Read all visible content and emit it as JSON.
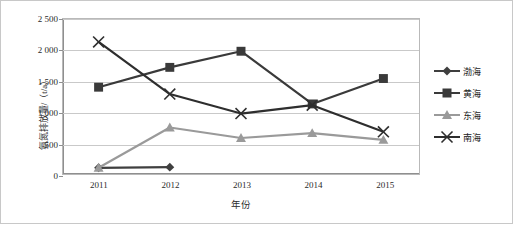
{
  "chart_data": {
    "type": "line",
    "title": "",
    "xlabel": "年份",
    "ylabel": "氨氮排放量/（t/a）",
    "x": [
      "2011",
      "2012",
      "2013",
      "2014",
      "2015"
    ],
    "categories": [
      "2011",
      "2012",
      "2013",
      "2014",
      "2015"
    ],
    "ylim": [
      0,
      2500
    ],
    "yticks": [
      0,
      500,
      1000,
      1500,
      2000,
      2500
    ],
    "ytick_labels": [
      "0",
      "500",
      "1 000",
      "1 500",
      "2 000",
      "2 500"
    ],
    "grid": true,
    "legend_position": "right",
    "series": [
      {
        "name": "渤海",
        "marker": "diamond",
        "color": "#3f3f3f",
        "values": [
          100,
          110,
          null,
          null,
          null
        ]
      },
      {
        "name": "黄海",
        "marker": "square",
        "color": "#3a3a3a",
        "values": [
          1400,
          1720,
          1980,
          1130,
          1540
        ]
      },
      {
        "name": "东海",
        "marker": "triangle",
        "color": "#9a9a9a",
        "values": [
          100,
          750,
          580,
          660,
          550
        ]
      },
      {
        "name": "南海",
        "marker": "x",
        "color": "#2e2e2e",
        "values": [
          2130,
          1290,
          975,
          1110,
          680
        ]
      }
    ]
  },
  "axis": {
    "y_label": "氨氮排放量/（t/a）",
    "x_label": "年份",
    "y_tick_0": "0",
    "y_tick_1": "500",
    "y_tick_2": "1 000",
    "y_tick_3": "1 500",
    "y_tick_4": "2 000",
    "y_tick_5": "2 500",
    "x_tick_0": "2011",
    "x_tick_1": "2012",
    "x_tick_2": "2013",
    "x_tick_3": "2014",
    "x_tick_4": "2015"
  },
  "legend": {
    "items": [
      {
        "label": "渤海"
      },
      {
        "label": "黄海"
      },
      {
        "label": "东海"
      },
      {
        "label": "南海"
      }
    ]
  },
  "colors": {
    "series_bohai": "#3f3f3f",
    "series_huanghai": "#3a3a3a",
    "series_donghai": "#9a9a9a",
    "series_nanhai": "#2e2e2e",
    "gridline": "#c9c9c9",
    "axis": "#8f8f8f",
    "background": "#ffffff"
  }
}
